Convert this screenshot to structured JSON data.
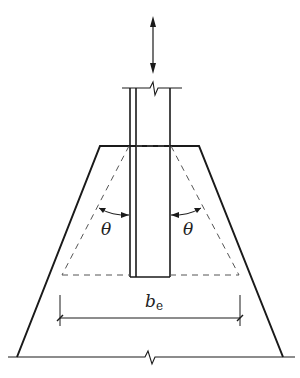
{
  "diagram": {
    "type": "structural-section",
    "labels": {
      "theta_left": "θ",
      "theta_right": "θ",
      "effective_width": "b",
      "effective_width_subscript": "e"
    },
    "elements": [
      "vertical-load-arrow",
      "column-with-break-line",
      "trapezoidal-footing",
      "dashed-load-spread-triangle",
      "angle-arrows",
      "effective-width-dimension",
      "ground-line-with-break"
    ],
    "colors": {
      "stroke": "#1a1a1a",
      "dashed": "#555555",
      "background": "#ffffff"
    }
  }
}
